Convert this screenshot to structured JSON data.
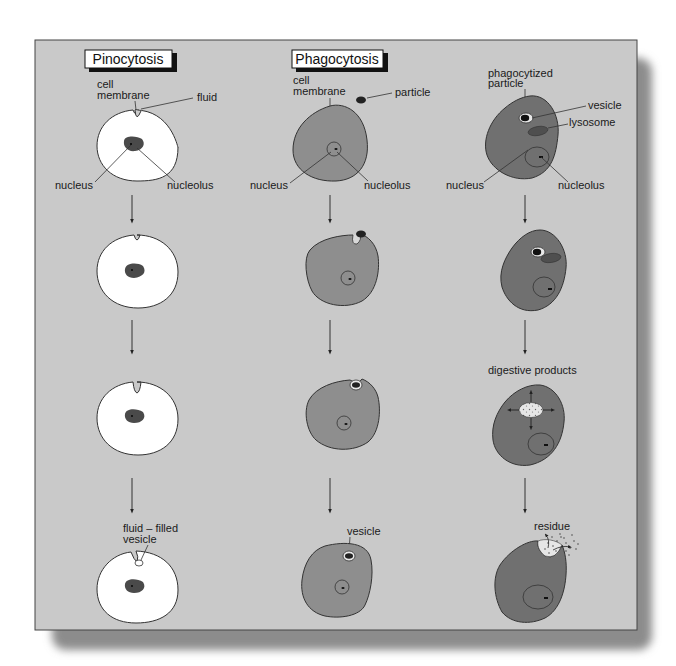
{
  "diagram": {
    "columns": [
      {
        "title": "Pinocytosis",
        "labels": {
          "cell_membrane": "cell membrane",
          "fluid": "fluid",
          "nucleus": "nucleus",
          "nucleolus": "nucleolus",
          "fluid_filled_vesicle_line1": "fluid – filled",
          "fluid_filled_vesicle_line2": "vesicle"
        }
      },
      {
        "title": "Phagocytosis",
        "labels": {
          "cell_line1": "cell",
          "membrane_line2": "membrane",
          "particle": "particle",
          "nucleus": "nucleus",
          "nucleolus": "nucleolus",
          "vesicle": "vesicle"
        }
      },
      {
        "title": "",
        "labels": {
          "phagocytized_line1": "phagocytized",
          "particle_line2": "particle",
          "vesicle": "vesicle",
          "lysosome": "lysosome",
          "nucleus": "nucleus",
          "nucleolus": "nucleolus",
          "digestive_products": "digestive products",
          "residue": "residue"
        }
      }
    ],
    "colors": {
      "panel_bg": "#c9c9c9",
      "pino_cell": "#ffffff",
      "phago_cell": "#8e8e8e",
      "digest_cell": "#707070",
      "nucleus_dark": "#4a4a4a",
      "outline": "#2a2a2a",
      "shadow": "#9a9a9a"
    }
  }
}
